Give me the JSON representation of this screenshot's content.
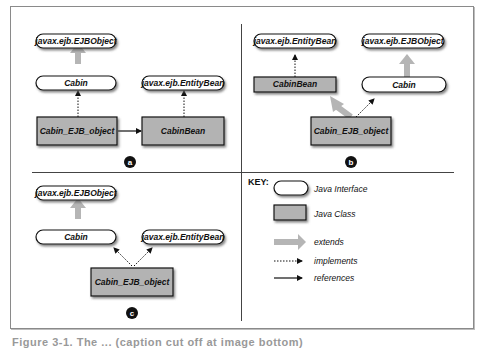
{
  "figure": {
    "caption": "Figure 3-1. The ... (caption cut off at image bottom)",
    "colors": {
      "class_fill": "#b3b3b3",
      "interface_fill": "#ffffff",
      "extends_arrow": "#b5b5b5",
      "stroke": "#111111",
      "frame": "#8a8a8a"
    }
  },
  "panels": {
    "a": {
      "badge": "a",
      "nodes": {
        "ejbobject": "javax.ejb.EJBObject",
        "cabin": "Cabin",
        "entitybean": "javax.ejb.EntityBean",
        "cabin_ejb_object": "Cabin_EJB_object",
        "cabinbean": "CabinBean"
      },
      "relations": [
        {
          "from": "Cabin",
          "to": "javax.ejb.EJBObject",
          "type": "extends"
        },
        {
          "from": "Cabin_EJB_object",
          "to": "Cabin",
          "type": "implements"
        },
        {
          "from": "CabinBean",
          "to": "javax.ejb.EntityBean",
          "type": "implements"
        },
        {
          "from": "Cabin_EJB_object",
          "to": "CabinBean",
          "type": "references"
        }
      ]
    },
    "b": {
      "badge": "b",
      "nodes": {
        "entitybean": "javax.ejb.EntityBean",
        "ejbobject": "javax.ejb.EJBObject",
        "cabinbean": "CabinBean",
        "cabin": "Cabin",
        "cabin_ejb_object": "Cabin_EJB_object"
      },
      "relations": [
        {
          "from": "CabinBean",
          "to": "javax.ejb.EntityBean",
          "type": "implements"
        },
        {
          "from": "Cabin",
          "to": "javax.ejb.EJBObject",
          "type": "extends"
        },
        {
          "from": "Cabin_EJB_object",
          "to": "CabinBean",
          "type": "extends"
        },
        {
          "from": "Cabin_EJB_object",
          "to": "Cabin",
          "type": "implements"
        }
      ]
    },
    "c": {
      "badge": "c",
      "nodes": {
        "ejbobject": "javax.ejb.EJBObject",
        "cabin": "Cabin",
        "entitybean": "javax.ejb.EntityBean",
        "cabin_ejb_object": "Cabin_EJB_object"
      },
      "relations": [
        {
          "from": "Cabin",
          "to": "javax.ejb.EJBObject",
          "type": "extends"
        },
        {
          "from": "Cabin_EJB_object",
          "to": "Cabin",
          "type": "implements"
        },
        {
          "from": "Cabin_EJB_object",
          "to": "javax.ejb.EntityBean",
          "type": "implements"
        }
      ]
    }
  },
  "key": {
    "title": "KEY:",
    "items": [
      {
        "symbol": "rounded-white-box",
        "label": "Java Interface"
      },
      {
        "symbol": "gray-rectangle",
        "label": "Java Class"
      },
      {
        "symbol": "thick-gray-arrow",
        "label": "extends"
      },
      {
        "symbol": "dotted-arrow",
        "label": "implements"
      },
      {
        "symbol": "solid-arrow",
        "label": "references"
      }
    ]
  }
}
